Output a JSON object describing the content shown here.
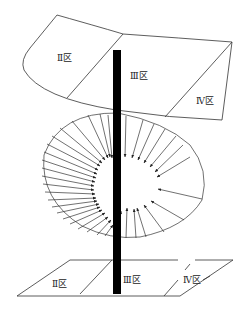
{
  "diagram": {
    "type": "zone-schematic",
    "colors": {
      "line": "#333333",
      "axis": "#000000",
      "background": "#ffffff"
    },
    "top_panel": {
      "zones": [
        {
          "id": "II",
          "label": "Ⅱ区"
        },
        {
          "id": "III",
          "label": "Ⅲ区"
        },
        {
          "id": "IV",
          "label": "Ⅳ区"
        }
      ]
    },
    "spiral": {
      "description": "Ellipse with radial arrows pointing inward toward a central vortex around the axis",
      "arrow_count_left": 22,
      "arrow_count_right": 14
    },
    "bottom_panel": {
      "zones": [
        {
          "id": "II",
          "label": "Ⅱ区"
        },
        {
          "id": "III",
          "label": "Ⅲ区"
        },
        {
          "id": "IV",
          "label": "Ⅳ区"
        }
      ]
    }
  }
}
